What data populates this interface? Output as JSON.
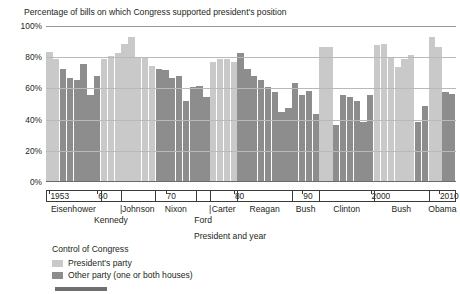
{
  "chart_data": {
    "type": "bar",
    "title": "Percentage of bills on which Congress supported president's position",
    "xlabel": "President and year",
    "ylabel": "",
    "ylim": [
      0,
      100
    ],
    "ytick_labels": [
      "0%",
      "20%",
      "40%",
      "60%",
      "80%",
      "100%"
    ],
    "ytick_values": [
      0,
      20,
      40,
      60,
      80,
      100
    ],
    "grid": true,
    "legend_position": "below-left",
    "legend_title": "Control of Congress",
    "series": [
      {
        "name": "President's party",
        "key": "p",
        "color": "#c9c9c9"
      },
      {
        "name": "Other party (one or both houses)",
        "key": "o",
        "color": "#8d8d8d"
      }
    ],
    "x": [
      1953,
      1954,
      1955,
      1956,
      1957,
      1958,
      1959,
      1960,
      1961,
      1962,
      1963,
      1964,
      1965,
      1966,
      1967,
      1968,
      1969,
      1970,
      1971,
      1972,
      1973,
      1974,
      1975,
      1976,
      1977,
      1978,
      1979,
      1980,
      1981,
      1982,
      1983,
      1984,
      1985,
      1986,
      1987,
      1988,
      1989,
      1990,
      1991,
      1992,
      1993,
      1994,
      1995,
      1996,
      1997,
      1998,
      1999,
      2000,
      2001,
      2002,
      2003,
      2004,
      2005,
      2006,
      2007,
      2008,
      2009,
      2010,
      2011,
      2012
    ],
    "values": [
      83,
      78,
      72,
      66,
      65,
      75,
      55,
      67,
      78,
      80,
      82,
      88,
      92,
      79,
      79,
      74,
      72,
      71,
      66,
      67,
      51,
      60,
      61,
      54,
      76,
      78,
      78,
      76,
      82,
      72,
      67,
      65,
      60,
      57,
      44,
      47,
      63,
      55,
      58,
      43,
      86,
      86,
      36,
      55,
      54,
      51,
      38,
      55,
      87,
      88,
      79,
      73,
      78,
      81,
      38,
      48,
      92,
      86,
      57,
      56
    ],
    "control": [
      "p",
      "p",
      "o",
      "o",
      "o",
      "o",
      "o",
      "o",
      "p",
      "p",
      "p",
      "p",
      "p",
      "p",
      "p",
      "p",
      "o",
      "o",
      "o",
      "o",
      "o",
      "o",
      "o",
      "o",
      "p",
      "p",
      "p",
      "p",
      "o",
      "o",
      "o",
      "o",
      "o",
      "o",
      "o",
      "o",
      "o",
      "o",
      "o",
      "o",
      "p",
      "p",
      "o",
      "o",
      "o",
      "o",
      "o",
      "o",
      "p",
      "p",
      "p",
      "p",
      "p",
      "p",
      "o",
      "o",
      "p",
      "p",
      "o",
      "o"
    ],
    "year_ticks": [
      {
        "year": 1953,
        "label": "1953"
      },
      {
        "year": 1960,
        "label": "60"
      },
      {
        "year": 1970,
        "label": "70"
      },
      {
        "year": 1980,
        "label": "80"
      },
      {
        "year": 1990,
        "label": "90"
      },
      {
        "year": 2000,
        "label": "2000"
      },
      {
        "year": 2010,
        "label": "2010"
      }
    ],
    "presidents": [
      {
        "name": "Eisenhower",
        "start": 1953,
        "end": 1960,
        "row": 1
      },
      {
        "name": "Kennedy",
        "start": 1961,
        "end": 1963,
        "row": 2
      },
      {
        "name": "Johnson",
        "start": 1964,
        "end": 1968,
        "row": 1
      },
      {
        "name": "Nixon",
        "start": 1969,
        "end": 1974,
        "row": 1
      },
      {
        "name": "Ford",
        "start": 1975,
        "end": 1976,
        "row": 2
      },
      {
        "name": "Carter",
        "start": 1977,
        "end": 1980,
        "row": 1
      },
      {
        "name": "Reagan",
        "start": 1981,
        "end": 1988,
        "row": 1
      },
      {
        "name": "Bush",
        "start": 1989,
        "end": 1992,
        "row": 1
      },
      {
        "name": "Clinton",
        "start": 1993,
        "end": 2000,
        "row": 1
      },
      {
        "name": "Bush",
        "start": 2001,
        "end": 2008,
        "row": 1
      },
      {
        "name": "Obama",
        "start": 2009,
        "end": 2012,
        "row": 1
      }
    ]
  }
}
